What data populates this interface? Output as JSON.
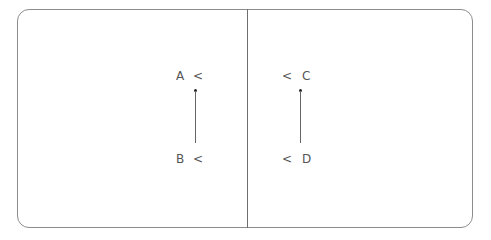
{
  "diagram": {
    "left_panel": {
      "top_label": "A",
      "top_marker": "<",
      "bottom_label": "B",
      "bottom_marker": "<"
    },
    "right_panel": {
      "top_label": "C",
      "top_marker": "<",
      "bottom_label": "D",
      "bottom_marker": "<"
    },
    "colors": {
      "border": "#8c8c8c",
      "line": "#666666",
      "text": "#555555",
      "dot": "#222222"
    }
  }
}
